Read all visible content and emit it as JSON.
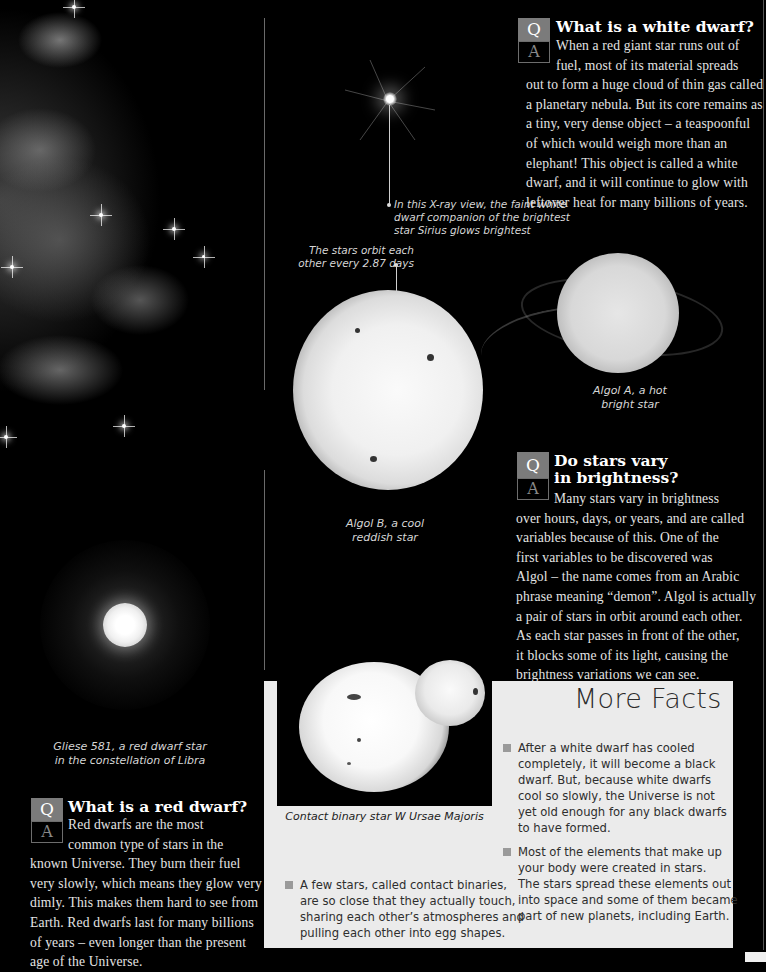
{
  "images": {
    "nebula": "supernova-remnant-nebula",
    "sirius": "sirius-xray-view",
    "algol_b": "algol-b-star",
    "algol_a": "algol-a-star",
    "gliese": "gliese-581-star",
    "contact_binary": "w-ursae-majoris-contact-binary"
  },
  "captions": {
    "sirius": [
      "In this X-ray view, the faint white",
      "dwarf companion of the brightest",
      "star Sirius glows brightest"
    ],
    "orbit": [
      "The stars orbit each",
      "other every 2.87 days"
    ],
    "algol_a": [
      "Algol A, a hot",
      "bright star"
    ],
    "algol_b": [
      "Algol B, a cool",
      "reddish star"
    ],
    "gliese": [
      "Gliese 581, a red dwarf star",
      "in the constellation of Libra"
    ],
    "contact_binary": "Contact binary star W Ursae Majoris"
  },
  "qa_badge": {
    "q": "Q",
    "a": "A"
  },
  "qa": [
    {
      "title": [
        "What is a white dwarf?"
      ],
      "body": [
        "When a red giant star runs out of",
        "fuel, most of its material spreads",
        "out to form a huge cloud of thin gas called",
        "a planetary nebula. But its core remains as",
        "a tiny, very dense object – a teaspoonful",
        "of which would weigh more than an",
        "elephant! This object is called a white",
        "dwarf, and it will continue to glow with",
        "leftover heat for many billions of years."
      ]
    },
    {
      "title": [
        "Do stars vary",
        "in brightness?"
      ],
      "body": [
        "Many stars vary in brightness",
        "over hours, days, or years, and are called",
        "variables because of this. One of the",
        "first variables to be discovered was",
        "Algol – the name comes from an Arabic",
        "phrase meaning “demon”. Algol is actually",
        "a pair of stars in orbit around each other.",
        "As each star passes in front of the other,",
        "it blocks some of its light, causing the",
        "brightness variations we can see."
      ]
    },
    {
      "title": [
        "What is a red dwarf?"
      ],
      "body": [
        "Red dwarfs are the most",
        "common type of stars in the",
        "known Universe. They burn their fuel",
        "very slowly, which means they glow very",
        "dimly. This makes them hard to see from",
        "Earth. Red dwarfs last for many billions",
        "of years – even longer than the present",
        "age of the Universe."
      ]
    }
  ],
  "more_facts": {
    "title": "More Facts",
    "items": [
      [
        "After a white dwarf has cooled",
        "completely, it will become a black",
        "dwarf. But, because white dwarfs",
        "cool so slowly, the Universe is not",
        "yet old enough for any black dwarfs",
        "to have formed."
      ],
      [
        "Most of the elements that make up",
        "your body were created in stars.",
        "The stars spread these elements out",
        "into space and some of them became",
        "part of new planets, including Earth."
      ]
    ]
  },
  "contact_binary_fact": [
    "A few stars, called contact binaries,",
    "are so close that they actually touch,",
    "sharing each other’s atmospheres and",
    "pulling each other into egg shapes."
  ],
  "colors": {
    "background": "#000000",
    "q_badge": "#7b7b7b",
    "panel": "#ebebeb",
    "bullet": "#9a9a9a"
  }
}
